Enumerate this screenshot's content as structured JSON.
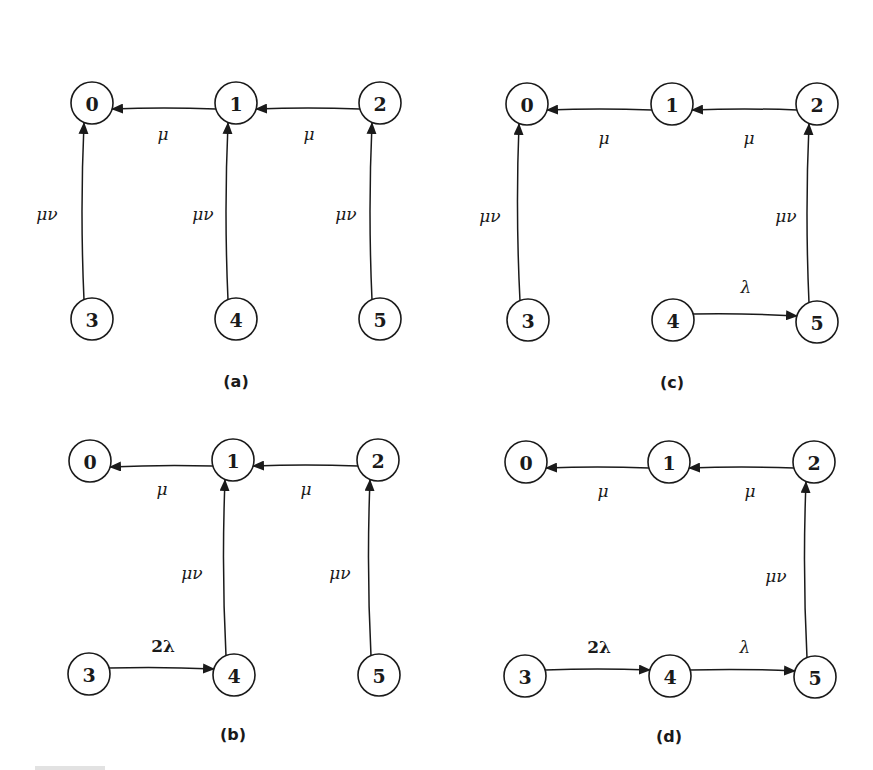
{
  "figure": {
    "node_radius": 21,
    "stroke_color": "#1a1a1a",
    "background": "#ffffff",
    "panels": [
      {
        "id": "a",
        "caption": "(a)",
        "caption_pos": [
          236,
          381
        ],
        "nodes": [
          {
            "id": "0",
            "label": "0",
            "x": 92,
            "y": 103
          },
          {
            "id": "1",
            "label": "1",
            "x": 236,
            "y": 103
          },
          {
            "id": "2",
            "label": "2",
            "x": 380,
            "y": 103
          },
          {
            "id": "3",
            "label": "3",
            "x": 92,
            "y": 319
          },
          {
            "id": "4",
            "label": "4",
            "x": 236,
            "y": 319
          },
          {
            "id": "5",
            "label": "5",
            "x": 380,
            "y": 319
          }
        ],
        "edges": [
          {
            "from": "1",
            "to": "0",
            "label": "μ",
            "label_pos": [
              163,
              134
            ],
            "bold": false
          },
          {
            "from": "2",
            "to": "1",
            "label": "μ",
            "label_pos": [
              309,
              134
            ],
            "bold": false
          },
          {
            "from": "3",
            "to": "0",
            "label": "μν",
            "label_pos": [
              47,
              214
            ],
            "bold": false
          },
          {
            "from": "4",
            "to": "1",
            "label": "μν",
            "label_pos": [
              203,
              214
            ],
            "bold": false
          },
          {
            "from": "5",
            "to": "2",
            "label": "μν",
            "label_pos": [
              346,
              214
            ],
            "bold": false
          }
        ]
      },
      {
        "id": "c",
        "caption": "(c)",
        "caption_pos": [
          672,
          382
        ],
        "nodes": [
          {
            "id": "0",
            "label": "0",
            "x": 527,
            "y": 104
          },
          {
            "id": "1",
            "label": "1",
            "x": 672,
            "y": 104
          },
          {
            "id": "2",
            "label": "2",
            "x": 817,
            "y": 104
          },
          {
            "id": "3",
            "label": "3",
            "x": 528,
            "y": 320
          },
          {
            "id": "4",
            "label": "4",
            "x": 673,
            "y": 320
          },
          {
            "id": "5",
            "label": "5",
            "x": 817,
            "y": 322
          }
        ],
        "edges": [
          {
            "from": "1",
            "to": "0",
            "label": "μ",
            "label_pos": [
              604,
              138
            ],
            "bold": false
          },
          {
            "from": "2",
            "to": "1",
            "label": "μ",
            "label_pos": [
              749,
              138
            ],
            "bold": false
          },
          {
            "from": "3",
            "to": "0",
            "label": "μν",
            "label_pos": [
              490,
              216
            ],
            "bold": false
          },
          {
            "from": "5",
            "to": "2",
            "label": "μν",
            "label_pos": [
              786,
              216
            ],
            "bold": false
          },
          {
            "from": "4",
            "to": "5",
            "label": "λ",
            "label_pos": [
              746,
              287
            ],
            "bold": false
          }
        ]
      },
      {
        "id": "b",
        "caption": "(b)",
        "caption_pos": [
          233,
          734
        ],
        "nodes": [
          {
            "id": "0",
            "label": "0",
            "x": 90,
            "y": 461
          },
          {
            "id": "1",
            "label": "1",
            "x": 233,
            "y": 460
          },
          {
            "id": "2",
            "label": "2",
            "x": 378,
            "y": 460
          },
          {
            "id": "3",
            "label": "3",
            "x": 89,
            "y": 674
          },
          {
            "id": "4",
            "label": "4",
            "x": 234,
            "y": 675
          },
          {
            "id": "5",
            "label": "5",
            "x": 379,
            "y": 675
          }
        ],
        "edges": [
          {
            "from": "1",
            "to": "0",
            "label": "μ",
            "label_pos": [
              162,
              489
            ],
            "bold": false
          },
          {
            "from": "2",
            "to": "1",
            "label": "μ",
            "label_pos": [
              306,
              489
            ],
            "bold": false
          },
          {
            "from": "4",
            "to": "1",
            "label": "μν",
            "label_pos": [
              192,
              573
            ],
            "bold": false
          },
          {
            "from": "5",
            "to": "2",
            "label": "μν",
            "label_pos": [
              340,
              573
            ],
            "bold": false
          },
          {
            "from": "3",
            "to": "4",
            "label": "2λ",
            "label_pos": [
              163,
              646
            ],
            "bold": true
          }
        ]
      },
      {
        "id": "d",
        "caption": "(d)",
        "caption_pos": [
          669,
          736
        ],
        "nodes": [
          {
            "id": "0",
            "label": "0",
            "x": 526,
            "y": 462
          },
          {
            "id": "1",
            "label": "1",
            "x": 669,
            "y": 462
          },
          {
            "id": "2",
            "label": "2",
            "x": 814,
            "y": 462
          },
          {
            "id": "3",
            "label": "3",
            "x": 525,
            "y": 676
          },
          {
            "id": "4",
            "label": "4",
            "x": 670,
            "y": 676
          },
          {
            "id": "5",
            "label": "5",
            "x": 815,
            "y": 677
          }
        ],
        "edges": [
          {
            "from": "1",
            "to": "0",
            "label": "μ",
            "label_pos": [
              603,
              491
            ],
            "bold": false
          },
          {
            "from": "2",
            "to": "1",
            "label": "μ",
            "label_pos": [
              750,
              491
            ],
            "bold": false
          },
          {
            "from": "5",
            "to": "2",
            "label": "μν",
            "label_pos": [
              776,
              576
            ],
            "bold": false
          },
          {
            "from": "3",
            "to": "4",
            "label": "2λ",
            "label_pos": [
              599,
              647
            ],
            "bold": true
          },
          {
            "from": "4",
            "to": "5",
            "label": "λ",
            "label_pos": [
              745,
              647
            ],
            "bold": false
          }
        ]
      }
    ]
  }
}
